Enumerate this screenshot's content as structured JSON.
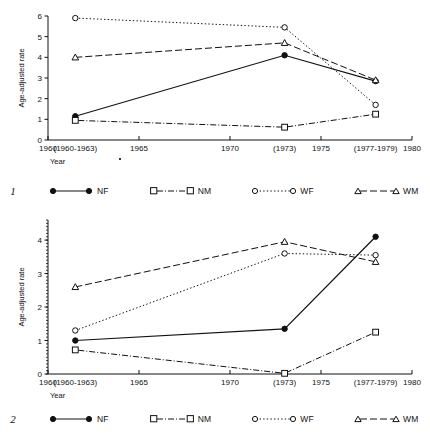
{
  "figures": [
    {
      "index_label": "1",
      "xlabel": "Year",
      "ylabel": "Age-adjusted rate",
      "x_ticks": [
        "1960",
        "1965",
        "1970",
        "1975",
        "1980"
      ],
      "x_point_labels": [
        "(1960-1963)",
        "(1973)",
        "(1977-1979)"
      ],
      "y_ticks": [
        "0",
        "1",
        "2",
        "3",
        "4",
        "5",
        "6"
      ],
      "legend": [
        {
          "key": "NF",
          "label": "NF",
          "marker": "filled-circle",
          "dash": "solid"
        },
        {
          "key": "NM",
          "label": "NM",
          "marker": "open-square",
          "dash": "dash-dot"
        },
        {
          "key": "WF",
          "label": "WF",
          "marker": "open-circle",
          "dash": "dotted"
        },
        {
          "key": "WM",
          "label": "WM",
          "marker": "open-triangle",
          "dash": "dashed"
        }
      ]
    },
    {
      "index_label": "2",
      "xlabel": "Year",
      "ylabel": "Age-adjusted rate",
      "x_ticks": [
        "1960",
        "1965",
        "1970",
        "1975",
        "1980"
      ],
      "x_point_labels": [
        "(1960-1963)",
        "(1973)",
        "(1977-1979)"
      ],
      "y_ticks": [
        "0",
        "1",
        "2",
        "3",
        "4"
      ],
      "legend": [
        {
          "key": "NF",
          "label": "NF",
          "marker": "filled-circle",
          "dash": "solid"
        },
        {
          "key": "NM",
          "label": "NM",
          "marker": "open-square",
          "dash": "dash-dot"
        },
        {
          "key": "WF",
          "label": "WF",
          "marker": "open-circle",
          "dash": "dotted"
        },
        {
          "key": "WM",
          "label": "WM",
          "marker": "open-triangle",
          "dash": "dashed"
        }
      ]
    }
  ],
  "chart_data": [
    {
      "type": "line",
      "title": "",
      "index_label": "1",
      "xlabel": "Year",
      "ylabel": "Age-adjusted rate",
      "x": [
        1961.5,
        1973,
        1978
      ],
      "x_tick_labels": [
        "1960",
        "1965",
        "1970",
        "1975",
        "1980"
      ],
      "x_tick_values": [
        1960,
        1965,
        1970,
        1975,
        1980
      ],
      "x_point_labels": [
        "(1960-1963)",
        "(1973)",
        "(1977-1979)"
      ],
      "xlim": [
        1960,
        1980
      ],
      "ylim": [
        0,
        6
      ],
      "y_ticks": [
        0,
        1,
        2,
        3,
        4,
        5,
        6
      ],
      "grid": false,
      "legend_position": "below",
      "series": [
        {
          "name": "NF",
          "marker": "filled-circle",
          "dash": "solid",
          "values": [
            1.15,
            4.1,
            2.85
          ]
        },
        {
          "name": "NM",
          "marker": "open-square",
          "dash": "dash-dot",
          "values": [
            0.95,
            0.62,
            1.25
          ]
        },
        {
          "name": "WF",
          "marker": "open-circle",
          "dash": "dotted",
          "values": [
            5.9,
            5.45,
            1.7
          ]
        },
        {
          "name": "WM",
          "marker": "open-triangle",
          "dash": "dashed",
          "values": [
            4.0,
            4.7,
            2.9
          ]
        }
      ]
    },
    {
      "type": "line",
      "title": "",
      "index_label": "2",
      "xlabel": "Year",
      "ylabel": "Age-adjusted rate",
      "x": [
        1961.5,
        1973,
        1978
      ],
      "x_tick_labels": [
        "1960",
        "1965",
        "1970",
        "1975",
        "1980"
      ],
      "x_tick_values": [
        1960,
        1965,
        1970,
        1975,
        1980
      ],
      "x_point_labels": [
        "(1960-1963)",
        "(1973)",
        "(1977-1979)"
      ],
      "xlim": [
        1960,
        1980
      ],
      "ylim": [
        0,
        4.6
      ],
      "y_ticks": [
        0,
        1,
        2,
        3,
        4
      ],
      "grid": false,
      "legend_position": "below",
      "series": [
        {
          "name": "NF",
          "marker": "filled-circle",
          "dash": "solid",
          "values": [
            1.0,
            1.35,
            4.1
          ]
        },
        {
          "name": "NM",
          "marker": "open-square",
          "dash": "dash-dot",
          "values": [
            0.72,
            0.02,
            1.25
          ]
        },
        {
          "name": "WF",
          "marker": "open-circle",
          "dash": "dotted",
          "values": [
            1.3,
            3.6,
            3.55
          ]
        },
        {
          "name": "WM",
          "marker": "open-triangle",
          "dash": "dashed",
          "values": [
            2.6,
            3.95,
            3.35
          ]
        }
      ]
    }
  ],
  "colors": {
    "ink": "#111111",
    "background": "#ffffff"
  }
}
